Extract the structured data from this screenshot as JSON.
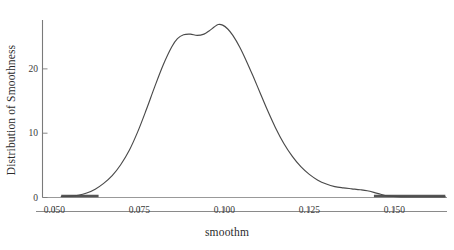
{
  "chart_data": {
    "type": "line",
    "title": "",
    "subtitle": "",
    "xlabel": "smoothm",
    "ylabel": "Distribution of Smoothness",
    "xlim": [
      0.0465,
      0.1655
    ],
    "ylim": [
      0,
      27.6
    ],
    "grid": false,
    "legend": null,
    "xticks": [
      "0.050",
      "0.075",
      "0.100",
      "0.125",
      "0.150"
    ],
    "xtick_values": [
      0.05,
      0.075,
      0.1,
      0.125,
      0.15
    ],
    "yticks": [
      "0",
      "10",
      "20"
    ],
    "ytick_values": [
      0,
      10,
      20
    ],
    "line_color": "#4a4a4a",
    "axis_color": "#7a7a7a",
    "rug_color": "#555555",
    "series": [
      {
        "name": "Distribution of Smoothness",
        "x": [
          0.052,
          0.0545,
          0.057,
          0.0595,
          0.062,
          0.0645,
          0.067,
          0.0695,
          0.072,
          0.0745,
          0.077,
          0.0795,
          0.082,
          0.0845,
          0.0862,
          0.088,
          0.09,
          0.092,
          0.094,
          0.0955,
          0.097,
          0.0982,
          0.0995,
          0.101,
          0.1025,
          0.1045,
          0.1065,
          0.1085,
          0.1105,
          0.1125,
          0.115,
          0.1175,
          0.12,
          0.1225,
          0.125,
          0.1275,
          0.13,
          0.1325,
          0.135,
          0.1375,
          0.14,
          0.142,
          0.144,
          0.146,
          0.148,
          0.152,
          0.157,
          0.162,
          0.165
        ],
        "y": [
          0.15,
          0.2,
          0.35,
          0.7,
          1.3,
          2.2,
          3.4,
          5.1,
          7.3,
          10.2,
          13.6,
          17.2,
          20.6,
          23.4,
          24.7,
          25.3,
          25.4,
          25.2,
          25.4,
          25.9,
          26.5,
          26.9,
          26.8,
          26.2,
          25.2,
          23.4,
          21.2,
          18.8,
          16.3,
          13.8,
          10.9,
          8.4,
          6.4,
          4.8,
          3.6,
          2.7,
          2.1,
          1.7,
          1.5,
          1.35,
          1.2,
          1.05,
          0.8,
          0.5,
          0.25,
          0.1,
          0.08,
          0.1,
          0.1
        ]
      }
    ],
    "rug_segments": [
      {
        "x_start": 0.052,
        "x_end": 0.063,
        "y": 0
      },
      {
        "x_start": 0.144,
        "x_end": 0.165,
        "y": 0
      }
    ]
  },
  "axes": {
    "x_axis_label": "smoothm",
    "y_axis_label": "Distribution of Smoothness"
  }
}
